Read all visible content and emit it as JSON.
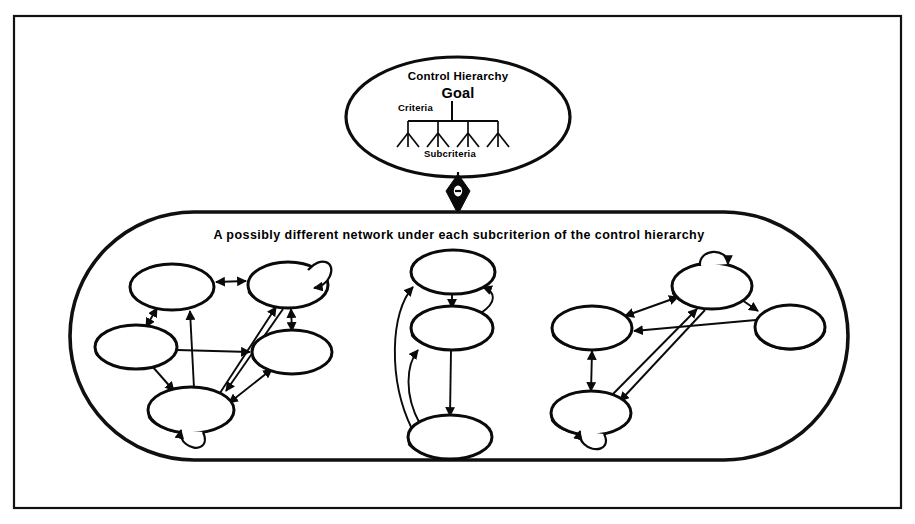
{
  "figure": {
    "name": "control-hierarchy-and-network-diagram",
    "background_color": "#ffffff",
    "ink_color": "#0a0a0a",
    "frame": {
      "x": 14,
      "y": 16,
      "width": 887,
      "height": 492
    }
  },
  "hierarchy": {
    "title": "Control Hierarchy",
    "goal_label": "Goal",
    "criteria_label": "Criteria",
    "subcriteria_label": "Subcriteria",
    "ellipse": {
      "cx": 458,
      "cy": 117,
      "rx": 112,
      "ry": 60
    },
    "tree": {
      "branches": 4,
      "leaves_per_branch": 3
    }
  },
  "connector": {
    "name": "double-arrow-diamond-connector",
    "shape": "diamond",
    "x": 458,
    "y": 190
  },
  "network_container": {
    "caption": "A possibly different network under each subcriterion of the control hierarchy",
    "shape": "stadium",
    "x": 70,
    "y": 212,
    "width": 778,
    "height": 248
  },
  "clusters": [
    {
      "name": "left-network-cluster",
      "node_count": 5,
      "self_loops": 2,
      "nodes": [
        {
          "id": "L1",
          "cx": 172,
          "cy": 287,
          "rx": 42,
          "ry": 23
        },
        {
          "id": "L2",
          "cx": 288,
          "cy": 285,
          "rx": 40,
          "ry": 23,
          "self_loop": "top-right"
        },
        {
          "id": "L3",
          "cx": 136,
          "cy": 347,
          "rx": 41,
          "ry": 22
        },
        {
          "id": "L4",
          "cx": 292,
          "cy": 352,
          "rx": 40,
          "ry": 22
        },
        {
          "id": "L5",
          "cx": 191,
          "cy": 410,
          "rx": 43,
          "ry": 23,
          "self_loop": "bottom"
        }
      ]
    },
    {
      "name": "middle-network-cluster",
      "node_count": 3,
      "self_loops": 0,
      "nodes": [
        {
          "id": "M1",
          "cx": 453,
          "cy": 272,
          "rx": 42,
          "ry": 22
        },
        {
          "id": "M2",
          "cx": 452,
          "cy": 328,
          "rx": 41,
          "ry": 22
        },
        {
          "id": "M3",
          "cx": 450,
          "cy": 437,
          "rx": 42,
          "ry": 22
        }
      ]
    },
    {
      "name": "right-network-cluster",
      "node_count": 4,
      "self_loops": 2,
      "nodes": [
        {
          "id": "R1",
          "cx": 712,
          "cy": 286,
          "rx": 40,
          "ry": 23,
          "self_loop": "top"
        },
        {
          "id": "R2",
          "cx": 592,
          "cy": 328,
          "rx": 40,
          "ry": 22
        },
        {
          "id": "R3",
          "cx": 790,
          "cy": 327,
          "rx": 35,
          "ry": 22
        },
        {
          "id": "R4",
          "cx": 591,
          "cy": 413,
          "rx": 40,
          "ry": 22,
          "self_loop": "bottom"
        }
      ]
    }
  ]
}
